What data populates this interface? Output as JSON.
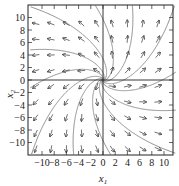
{
  "chart_data": {
    "type": "quiver",
    "title": "",
    "xlabel": "x1",
    "ylabel": "x2",
    "xlim": [
      -12,
      12
    ],
    "ylim": [
      -12,
      12
    ],
    "xticks": [
      -10,
      -8,
      -6,
      -4,
      -2,
      0,
      2,
      4,
      6,
      8,
      10
    ],
    "yticks": [
      -10,
      -8,
      -6,
      -4,
      -2,
      0,
      2,
      4,
      6,
      8,
      10
    ],
    "xtick_labels": [
      "-10",
      "-8",
      "-6",
      "-4",
      "-2",
      "0",
      "2",
      "4",
      "6",
      "8",
      "10"
    ],
    "ytick_labels": [
      "-10",
      "-8",
      "-6",
      "-4",
      "-2",
      "0",
      "2",
      "4",
      "6",
      "8",
      "10"
    ],
    "grid": false,
    "axes_through_origin": true,
    "system": {
      "description": "Linear system with spiral source at origin",
      "dx1": "x1 - 0.5*x2",
      "dx2": "0.5*x1 + x2"
    },
    "arrow_grid_spacing": 2.5,
    "trajectories_count": 12,
    "colors": {
      "arrows": "#333333",
      "trajectories": "#8a8a8a",
      "axes": "#222222"
    }
  }
}
